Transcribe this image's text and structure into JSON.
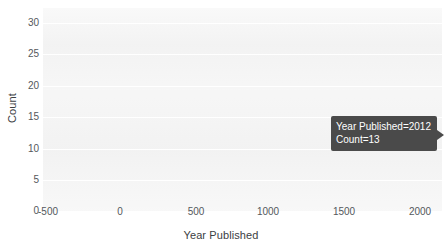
{
  "chart_data": {
    "type": "bar",
    "title": "",
    "xlabel": "Year Published",
    "ylabel": "Count",
    "xlim": [
      -500,
      2000
    ],
    "ylim": [
      0,
      32
    ],
    "grid": true,
    "legend": false,
    "x_ticks": [
      "-500",
      "0",
      "500",
      "1000",
      "1500",
      "2000"
    ],
    "x_tick_values": [
      -500,
      0,
      500,
      1000,
      1500,
      2000
    ],
    "y_ticks": [
      "0",
      "5",
      "10",
      "15",
      "20",
      "25",
      "30"
    ],
    "y_tick_values": [
      0,
      5,
      10,
      15,
      20,
      25,
      30
    ],
    "categories": [
      2012
    ],
    "values": [
      13
    ],
    "series": [
      {
        "name": "Count",
        "x": [
          2012
        ],
        "values": [
          13
        ]
      }
    ],
    "annotations": [
      {
        "type": "hover-tooltip",
        "x": 2012,
        "y": 13,
        "lines": [
          "Year Published=2012",
          "Count=13"
        ]
      }
    ]
  },
  "axes": {
    "x_title": "Year Published",
    "y_title": "Count",
    "x_ticks": [
      {
        "label": "-500",
        "value": -500
      },
      {
        "label": "0",
        "value": 0
      },
      {
        "label": "500",
        "value": 500
      },
      {
        "label": "1000",
        "value": 1000
      },
      {
        "label": "1500",
        "value": 1500
      },
      {
        "label": "2000",
        "value": 2000
      }
    ],
    "y_ticks": [
      {
        "label": "30",
        "value": 30
      },
      {
        "label": "25",
        "value": 25
      },
      {
        "label": "20",
        "value": 20
      },
      {
        "label": "15",
        "value": 15
      },
      {
        "label": "10",
        "value": 10
      },
      {
        "label": "5",
        "value": 5
      },
      {
        "label": "0",
        "value": 0
      }
    ]
  },
  "tooltip": {
    "line1": "Year Published=2012",
    "line2": "Count=13"
  },
  "colors": {
    "plot_background": "#f2f2f2",
    "page_background": "#ffffff",
    "gridline": "#ffffff",
    "tick_text": "#54585c",
    "axis_title_text": "#3c4043",
    "tooltip_background": "#4a4a4a",
    "tooltip_text": "#ffffff"
  }
}
